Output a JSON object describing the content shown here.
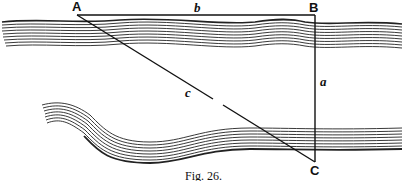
{
  "figure": {
    "caption": "Fig. 26.",
    "points": {
      "A": {
        "label": "A",
        "x": 77,
        "y": 15
      },
      "B": {
        "label": "B",
        "x": 315,
        "y": 15
      },
      "C": {
        "label": "C",
        "x": 315,
        "y": 162
      }
    },
    "segments": {
      "a": {
        "label": "a",
        "from": "B",
        "to": "C"
      },
      "b": {
        "label": "b",
        "from": "A",
        "to": "B"
      },
      "c": {
        "label": "c",
        "from": "A",
        "to": "C",
        "gap": true
      }
    },
    "features": [
      "river-bank-upper",
      "river-bank-lower"
    ],
    "colors": {
      "ink": "#111111",
      "paper": "#ffffff"
    }
  }
}
